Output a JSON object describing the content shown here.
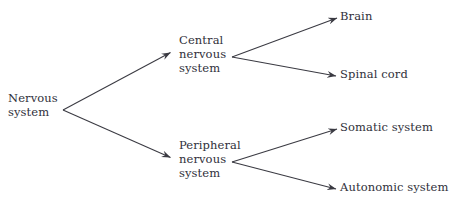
{
  "diagram": {
    "type": "tree",
    "orientation": "left-to-right",
    "background_color": "#ffffff",
    "line_color": "#3a3a42",
    "text_color": "#30303a",
    "root": {
      "id": "nervous-system",
      "label": "Nervous\nsystem"
    },
    "level_two": [
      {
        "id": "central-nervous-system",
        "label": "Central\nnervous\nsystem"
      },
      {
        "id": "peripheral-nervous-system",
        "label": "Peripheral\nnervous\nsystem"
      }
    ],
    "leaves": [
      {
        "id": "brain",
        "label": "Brain",
        "parent": "central-nervous-system"
      },
      {
        "id": "spinal-cord",
        "label": "Spinal cord",
        "parent": "central-nervous-system"
      },
      {
        "id": "somatic-system",
        "label": "Somatic system",
        "parent": "peripheral-nervous-system"
      },
      {
        "id": "autonomic-system",
        "label": "Autonomic system",
        "parent": "peripheral-nervous-system"
      }
    ],
    "edges": [
      {
        "from": "nervous-system",
        "to": "central-nervous-system",
        "arrow": "end"
      },
      {
        "from": "nervous-system",
        "to": "peripheral-nervous-system",
        "arrow": "end"
      },
      {
        "from": "central-nervous-system",
        "to": "brain",
        "arrow": "end"
      },
      {
        "from": "central-nervous-system",
        "to": "spinal-cord",
        "arrow": "end"
      },
      {
        "from": "peripheral-nervous-system",
        "to": "somatic-system",
        "arrow": "end"
      },
      {
        "from": "peripheral-nervous-system",
        "to": "autonomic-system",
        "arrow": "end"
      }
    ]
  }
}
